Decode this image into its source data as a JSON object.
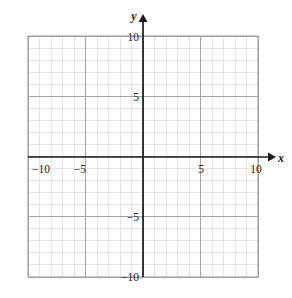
{
  "chart_data": {
    "type": "scatter",
    "title": "",
    "subtitle": "",
    "xlabel": "x",
    "ylabel": "y",
    "xlim": [
      -10,
      10
    ],
    "ylim": [
      -10,
      10
    ],
    "x_major_ticks": [
      -10,
      -5,
      5,
      10
    ],
    "y_major_ticks": [
      -10,
      -5,
      5,
      10
    ],
    "x_tick_labels": [
      "−10",
      "−5",
      "5",
      "10"
    ],
    "y_tick_labels": [
      "−10",
      "−5",
      "5",
      "10"
    ],
    "minor_tick_step": 1,
    "major_tick_step": 5,
    "grid": true,
    "grid_minor": true,
    "grid_major": true,
    "legend": null,
    "legend_position": "none",
    "series": [],
    "annotations": [],
    "axis_arrows": {
      "x_positive": true,
      "y_positive": true
    },
    "colors": {
      "background": "#ffffff",
      "grid_minor": "#dddddd",
      "grid_major": "#9a9a9a",
      "axis": "#1a1a1a",
      "text": "#1a1a1a"
    }
  },
  "labels": {
    "x_axis_name": "x",
    "y_axis_name": "y",
    "x_neg_ten": "−10",
    "x_neg_five": "−5",
    "x_pos_five": "5",
    "x_pos_ten": "10",
    "y_neg_ten": "−10",
    "y_neg_five": "−5",
    "y_pos_five": "5",
    "y_pos_ten": "10"
  }
}
